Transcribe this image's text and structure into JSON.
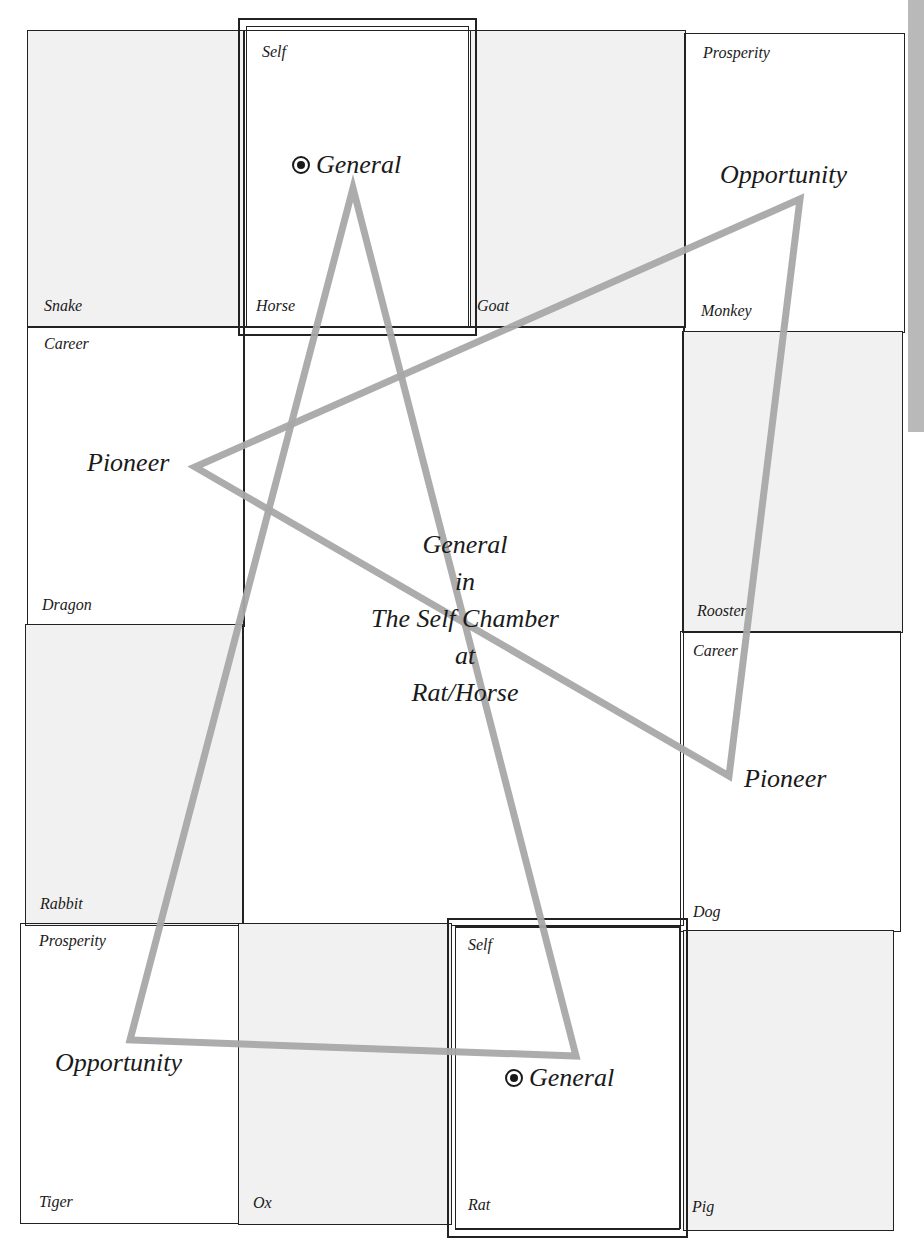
{
  "diagram": {
    "title_center": {
      "line1": "General",
      "line2": "in",
      "line3": "The Self Chamber",
      "line4": "at",
      "line5": "Rat/Horse"
    },
    "cells": {
      "snake": {
        "animal": "Snake",
        "chamber": ""
      },
      "horse": {
        "animal": "Horse",
        "chamber": "Self"
      },
      "goat": {
        "animal": "Goat",
        "chamber": ""
      },
      "monkey": {
        "animal": "Monkey",
        "chamber": "Prosperity"
      },
      "dragon": {
        "animal": "Dragon",
        "chamber": "Career"
      },
      "rooster": {
        "animal": "Rooster",
        "chamber": ""
      },
      "rabbit": {
        "animal": "Rabbit",
        "chamber": ""
      },
      "dog": {
        "animal": "Dog",
        "chamber": "Career"
      },
      "tiger": {
        "animal": "Tiger",
        "chamber": "Prosperity"
      },
      "ox": {
        "animal": "Ox",
        "chamber": ""
      },
      "rat": {
        "animal": "Rat",
        "chamber": "Self"
      },
      "pig": {
        "animal": "Pig",
        "chamber": ""
      }
    },
    "stars": {
      "general_top": "General",
      "general_bottom": "General",
      "opportunity_top_right": "Opportunity",
      "opportunity_bottom_left": "Opportunity",
      "pioneer_left": "Pioneer",
      "pioneer_right": "Pioneer"
    },
    "colors": {
      "line": "#222222",
      "shaded_cell": "#f1f1f1",
      "star_stroke": "#a8a8a8",
      "side_strip": "#b9b9b9"
    },
    "star_polygons": {
      "triangle_general": [
        [
          353,
          188
        ],
        [
          576,
          1056
        ],
        [
          130,
          1040
        ]
      ],
      "triangle_pioneer": [
        [
          195,
          467
        ],
        [
          800,
          199
        ],
        [
          729,
          776
        ]
      ]
    }
  }
}
